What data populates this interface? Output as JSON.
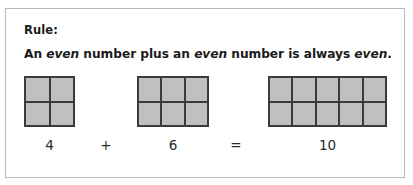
{
  "card": {
    "heading": "Rule:",
    "statement": {
      "part1": "An ",
      "em1": "even",
      "part2": " number plus an ",
      "em2": "even",
      "part3": " number is always ",
      "em3": "even",
      "part4": "."
    },
    "border_color": "#b9b9bd",
    "background": "#ffffff"
  },
  "models": {
    "cell_fill": "#c0c0c0",
    "grid_line": "#3b3b3b",
    "items": [
      {
        "name": "four",
        "value": 4,
        "columns": 2,
        "rows": 2,
        "cells": 4
      },
      {
        "name": "six",
        "value": 6,
        "columns": 3,
        "rows": 2,
        "cells": 6
      },
      {
        "name": "ten",
        "value": 10,
        "columns": 5,
        "rows": 2,
        "cells": 10
      }
    ]
  },
  "equation": {
    "term1": "4",
    "operator_plus": "+",
    "term2": "6",
    "operator_equals": "=",
    "result": "10",
    "expression": "4 + 6 = 10"
  },
  "chart_data": {
    "type": "bar",
    "categories": [
      "4",
      "6",
      "10"
    ],
    "values": [
      4,
      6,
      10
    ],
    "xlabel": "",
    "ylabel": "Number of unit squares",
    "annotations": [
      "4",
      "+",
      "6",
      "=",
      "10"
    ]
  }
}
